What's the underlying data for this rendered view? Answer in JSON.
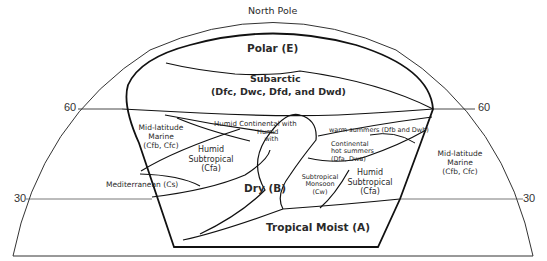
{
  "north_pole_label": "North Pole",
  "latitudes": {
    "lat60": "60",
    "lat30": "30"
  },
  "regions": {
    "polar": "Polar (E)",
    "subarctic_1": "Subarctic",
    "subarctic_2": "(Dfc, Dwc, Dfd, and Dwd)",
    "mlm_west_1": "Mid-latitude",
    "mlm_west_2": "Marine",
    "mlm_west_3": "(Cfb, Cfc)",
    "humid_cont_with": "Humid Continental with",
    "humid_with_1": "Humid",
    "humid_with_2": "with",
    "warm_summers": "warm summers (Dfb and Dwb)",
    "cont_hot_1": "Continental",
    "cont_hot_2": "hot summers",
    "cont_hot_3": "(Dfa, Dwa)",
    "mlm_east_1": "Mid-latitude",
    "mlm_east_2": "Marine",
    "mlm_east_3": "(Cfb, Cfc)",
    "hs_west_1": "Humid",
    "hs_west_2": "Subtropical",
    "hs_west_3": "(Cfa)",
    "mediterranean": "Mediterranean (Cs)",
    "dry": "Dry (B)",
    "sub_monsoon_1": "Subtropical",
    "sub_monsoon_2": "Monsoon",
    "sub_monsoon_3": "(Cw)",
    "hs_east_1": "Humid",
    "hs_east_2": "Subtropical",
    "hs_east_3": "(Cfa)",
    "tropical": "Tropical Moist (A)"
  },
  "colors": {
    "line": "#1a1a1a",
    "background": "#ffffff"
  }
}
